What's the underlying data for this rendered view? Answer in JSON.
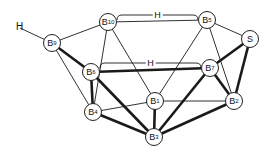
{
  "diagram": {
    "title": "",
    "colors": {
      "line": "#1a1a1a",
      "background": "#ffffff",
      "node_fill": "#ffffff"
    },
    "nodes": [
      {
        "id": "H",
        "base": "H",
        "sub": "",
        "x": 20,
        "y": 28,
        "circle": false
      },
      {
        "id": "B9",
        "base": "B",
        "sub": "9",
        "x": 52,
        "y": 43,
        "circle": true
      },
      {
        "id": "B10",
        "base": "B",
        "sub": "10",
        "x": 108,
        "y": 22,
        "circle": true
      },
      {
        "id": "B5",
        "base": "B",
        "sub": "5",
        "x": 207,
        "y": 20,
        "circle": true
      },
      {
        "id": "S",
        "base": "S",
        "sub": "",
        "x": 250,
        "y": 39,
        "circle": true
      },
      {
        "id": "B6",
        "base": "B",
        "sub": "6",
        "x": 91,
        "y": 72,
        "circle": true
      },
      {
        "id": "B7",
        "base": "B",
        "sub": "7",
        "x": 210,
        "y": 68,
        "circle": true
      },
      {
        "id": "B1",
        "base": "B",
        "sub": "1",
        "x": 155,
        "y": 101,
        "circle": true
      },
      {
        "id": "B4",
        "base": "B",
        "sub": "4",
        "x": 93,
        "y": 112,
        "circle": true
      },
      {
        "id": "B2",
        "base": "B",
        "sub": "2",
        "x": 234,
        "y": 101,
        "circle": true
      },
      {
        "id": "B3",
        "base": "B",
        "sub": "3",
        "x": 154,
        "y": 137,
        "circle": true
      }
    ],
    "edges": [
      {
        "from": "H",
        "to": "B9",
        "weight": "thin"
      },
      {
        "from": "B9",
        "to": "B10",
        "weight": "thin"
      },
      {
        "from": "B9",
        "to": "B6",
        "weight": "thick"
      },
      {
        "from": "B9",
        "to": "B4",
        "weight": "thin"
      },
      {
        "from": "B10",
        "to": "B5",
        "weight": "thin"
      },
      {
        "from": "B10",
        "to": "B4",
        "weight": "thin"
      },
      {
        "from": "B10",
        "to": "B1",
        "weight": "thin"
      },
      {
        "from": "B5",
        "to": "S",
        "weight": "thin"
      },
      {
        "from": "B5",
        "to": "B1",
        "weight": "thin"
      },
      {
        "from": "B5",
        "to": "B2",
        "weight": "thin"
      },
      {
        "from": "S",
        "to": "B7",
        "weight": "thick"
      },
      {
        "from": "S",
        "to": "B2",
        "weight": "thick"
      },
      {
        "from": "B6",
        "to": "B7",
        "weight": "thick"
      },
      {
        "from": "B6",
        "to": "B4",
        "weight": "thick"
      },
      {
        "from": "B6",
        "to": "B3",
        "weight": "thick"
      },
      {
        "from": "B7",
        "to": "B2",
        "weight": "thick"
      },
      {
        "from": "B7",
        "to": "B3",
        "weight": "thick"
      },
      {
        "from": "B4",
        "to": "B1",
        "weight": "thin"
      },
      {
        "from": "B4",
        "to": "B3",
        "weight": "thick"
      },
      {
        "from": "B1",
        "to": "B3",
        "weight": "thick"
      },
      {
        "from": "B1",
        "to": "B2",
        "weight": "thin"
      },
      {
        "from": "B2",
        "to": "B3",
        "weight": "thick"
      }
    ],
    "bridges": [
      {
        "from": "B10",
        "to": "B5",
        "label": "H"
      },
      {
        "from": "B6",
        "to": "B7",
        "label": "H"
      }
    ]
  }
}
